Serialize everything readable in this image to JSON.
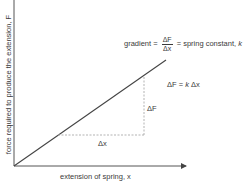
{
  "diagram": {
    "type": "force-extension graph",
    "y_axis_label": "force required to produce the extension, F",
    "x_axis_label": "extension of spring, x",
    "gradient_label": {
      "prefix": "gradient =",
      "numerator": "ΔF",
      "denominator": "Δx",
      "suffix": "= spring constant,",
      "suffix_var": "k"
    },
    "equation": {
      "lhs": "ΔF =",
      "k": "k",
      "rhs": "Δx"
    },
    "delta_f_label": "ΔF",
    "delta_x_label": "Δx",
    "colors": {
      "line": "#444444",
      "axis": "#555555",
      "dashed": "#aaaaaa",
      "text": "#3a3a3a"
    }
  }
}
